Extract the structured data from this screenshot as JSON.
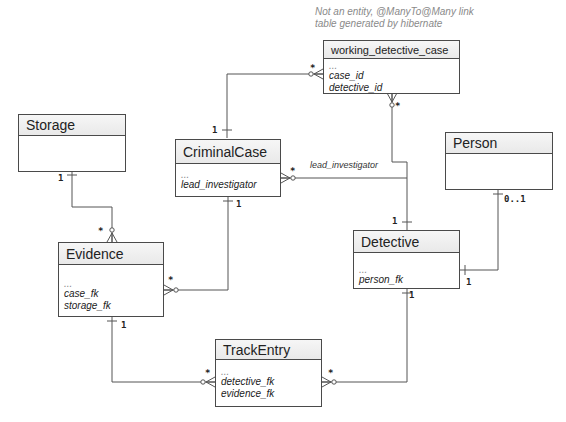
{
  "note": {
    "line1": "Not an entity, @ManyTo@Many link",
    "line2": "table generated by hibernate"
  },
  "entities": {
    "working_detective_case": {
      "title": "working_detective_case",
      "attrs": [
        "...",
        "case_id",
        "detective_id"
      ]
    },
    "storage": {
      "title": "Storage",
      "attrs": []
    },
    "criminal_case": {
      "title": "CriminalCase",
      "attrs": [
        "...",
        "lead_investigator"
      ]
    },
    "person": {
      "title": "Person",
      "attrs": []
    },
    "detective": {
      "title": "Detective",
      "attrs": [
        "...",
        "person_fk"
      ]
    },
    "evidence": {
      "title": "Evidence",
      "attrs": [
        "...",
        "case_fk",
        "storage_fk"
      ]
    },
    "track_entry": {
      "title": "TrackEntry",
      "attrs": [
        "...",
        "detective_fk",
        "evidence_fk"
      ]
    }
  },
  "relations": [
    {
      "from": "CriminalCase",
      "from_card": "1",
      "to": "working_detective_case",
      "to_card": "*"
    },
    {
      "from": "Detective",
      "from_card": "1",
      "to": "working_detective_case",
      "to_card": "*"
    },
    {
      "from": "Detective",
      "from_card": "1",
      "to": "CriminalCase",
      "to_card": "*",
      "label": "lead_investigator"
    },
    {
      "from": "Storage",
      "from_card": "1",
      "to": "Evidence",
      "to_card": "*"
    },
    {
      "from": "CriminalCase",
      "from_card": "1",
      "to": "Evidence",
      "to_card": "*"
    },
    {
      "from": "Person",
      "from_card": "0..1",
      "to": "Detective",
      "to_card": "1"
    },
    {
      "from": "Evidence",
      "from_card": "1",
      "to": "TrackEntry",
      "to_card": "*"
    },
    {
      "from": "Detective",
      "from_card": "1",
      "to": "TrackEntry",
      "to_card": "*"
    }
  ],
  "labels": {
    "lead_investigator": "lead_investigator",
    "one": "1",
    "many": "*",
    "zero_or_one": "0..1"
  },
  "colors": {
    "line": "#555555",
    "border": "#4a4a4a",
    "header_bg": "#eeeeee",
    "note_text": "#8a8a8a"
  }
}
